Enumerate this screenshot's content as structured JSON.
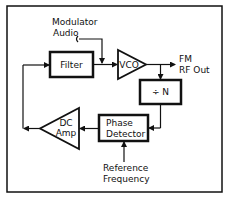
{
  "diagram": {
    "blocks": {
      "filter": {
        "label": "Filter"
      },
      "vco": {
        "label": "VCO"
      },
      "divider": {
        "label": "÷ N"
      },
      "phase_detector": {
        "label_line1": "Phase",
        "label_line2": "Detector"
      },
      "dc_amp": {
        "label_line1": "DC",
        "label_line2": "Amp"
      }
    },
    "signals": {
      "modulator_audio": {
        "line1": "Modulator",
        "line2": "Audio"
      },
      "fm_out": {
        "line1": "FM",
        "line2": "RF Out"
      },
      "reference": {
        "line1": "Reference",
        "line2": "Frequency"
      }
    },
    "colors": {
      "stroke": "#111111",
      "background": "#ffffff"
    }
  }
}
